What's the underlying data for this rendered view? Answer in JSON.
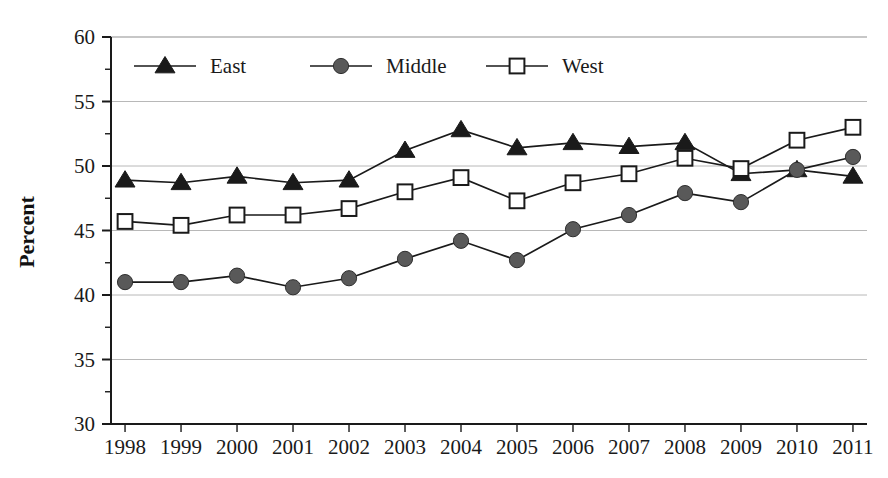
{
  "chart_data": {
    "type": "line",
    "title": "",
    "xlabel": "",
    "ylabel": "Percent",
    "categories": [
      "1998",
      "1999",
      "2000",
      "2001",
      "2002",
      "2003",
      "2004",
      "2005",
      "2006",
      "2007",
      "2008",
      "2009",
      "2010",
      "2011"
    ],
    "ylim": [
      30,
      60
    ],
    "ytick_step": 5,
    "yticks": [
      "30",
      "35",
      "40",
      "45",
      "50",
      "55",
      "60"
    ],
    "minor_tick_step": 2.5,
    "grid": "horizontal-major",
    "legend_position": "top-left-inside",
    "series": [
      {
        "name": "East",
        "marker": "filled-triangle",
        "color": "#1a1a1a",
        "values": [
          48.9,
          48.7,
          49.2,
          48.7,
          48.9,
          51.2,
          52.8,
          51.4,
          51.8,
          51.5,
          51.8,
          49.4,
          49.7,
          49.2
        ]
      },
      {
        "name": "Middle",
        "marker": "filled-circle",
        "color": "#595959",
        "values": [
          41.0,
          41.0,
          41.5,
          40.6,
          41.3,
          42.8,
          44.2,
          42.7,
          45.1,
          46.2,
          47.9,
          47.2,
          49.7,
          50.7
        ]
      },
      {
        "name": "West",
        "marker": "open-square",
        "color": "#1a1a1a",
        "values": [
          45.7,
          45.4,
          46.2,
          46.2,
          46.7,
          48.0,
          49.1,
          47.3,
          48.7,
          49.4,
          50.6,
          49.8,
          52.0,
          53.0
        ]
      }
    ]
  },
  "legend": {
    "items": [
      {
        "label": "East"
      },
      {
        "label": "Middle"
      },
      {
        "label": "West"
      }
    ]
  },
  "axes": {
    "y_title": "Percent"
  }
}
